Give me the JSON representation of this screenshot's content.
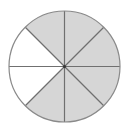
{
  "diagram": {
    "type": "fraction-circle",
    "total_parts": 8,
    "shaded_parts": 6,
    "unshaded_parts": 2,
    "fraction_shaded": "6/8",
    "colors": {
      "shaded": "#d6d6d6",
      "unshaded": "#ffffff",
      "line": "#707070",
      "outline": "#8a8a8a"
    },
    "slices": [
      {
        "index": 0,
        "shaded": true
      },
      {
        "index": 1,
        "shaded": true
      },
      {
        "index": 2,
        "shaded": true
      },
      {
        "index": 3,
        "shaded": true
      },
      {
        "index": 4,
        "shaded": true
      },
      {
        "index": 5,
        "shaded": false
      },
      {
        "index": 6,
        "shaded": false
      },
      {
        "index": 7,
        "shaded": true
      }
    ]
  }
}
